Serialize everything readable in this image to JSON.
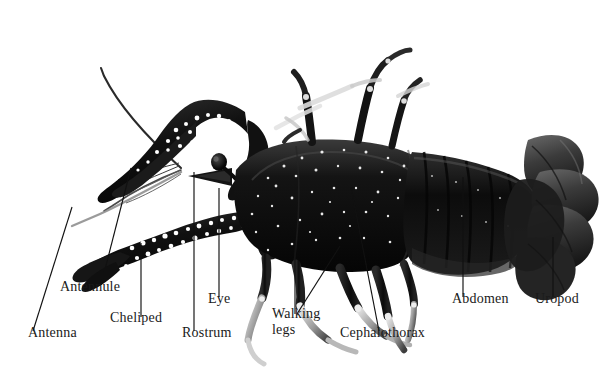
{
  "figure": {
    "view": "lateral whole-body photograph",
    "background_color": "#ffffff",
    "label_color": "#1a1a1a",
    "leader_color": "#111111",
    "specimen_colors": {
      "carapace_dark": "#0d0d0d",
      "carapace_mid": "#2b2b2b",
      "highlight": "#f0f0f0",
      "limb_pale": "#d8d8d8",
      "limb_shadow": "#555555",
      "speckle": "#ffffff"
    },
    "labels": [
      {
        "id": "antenna",
        "text": "Antenna",
        "x": 28,
        "y": 338,
        "leader": {
          "x1": 72,
          "y1": 207,
          "x2": 33,
          "y2": 331
        }
      },
      {
        "id": "antennule",
        "text": "Antennule",
        "x": 60,
        "y": 292,
        "leader": {
          "x1": 131,
          "y1": 168,
          "x2": 101,
          "y2": 285
        }
      },
      {
        "id": "cheliped",
        "text": "Cheliped",
        "x": 110,
        "y": 323,
        "leader": {
          "x1": 141,
          "y1": 243,
          "x2": 141,
          "y2": 317
        }
      },
      {
        "id": "rostrum",
        "text": "Rostrum",
        "x": 182,
        "y": 338,
        "leader": {
          "x1": 194,
          "y1": 172,
          "x2": 194,
          "y2": 331
        }
      },
      {
        "id": "eye",
        "text": "Eye",
        "x": 208,
        "y": 304,
        "leader": {
          "x1": 219,
          "y1": 188,
          "x2": 219,
          "y2": 297
        }
      },
      {
        "id": "walking-legs",
        "text": "Walking\nlegs",
        "x": 272,
        "y": 319,
        "leaders": [
          {
            "x1": 295,
            "y1": 243,
            "x2": 295,
            "y2": 314
          },
          {
            "x1": 340,
            "y1": 246,
            "x2": 297,
            "y2": 314
          }
        ]
      },
      {
        "id": "cephalothorax",
        "text": "Cephalothorax",
        "x": 340,
        "y": 338,
        "leader": {
          "x1": 351,
          "y1": 187,
          "x2": 379,
          "y2": 331
        }
      },
      {
        "id": "abdomen",
        "text": "Abdomen",
        "x": 452,
        "y": 304,
        "leader": {
          "x1": 463,
          "y1": 177,
          "x2": 463,
          "y2": 297
        }
      },
      {
        "id": "uropod",
        "text": "Uropod",
        "x": 535,
        "y": 304,
        "leader": {
          "x1": 553,
          "y1": 237,
          "x2": 553,
          "y2": 297
        }
      }
    ]
  }
}
